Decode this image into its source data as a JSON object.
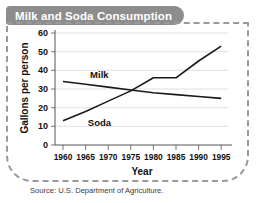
{
  "chart_data": {
    "type": "line",
    "title": "Milk and Soda Consumption",
    "xlabel": "Year",
    "ylabel": "Gallons per person",
    "x": [
      1960,
      1965,
      1970,
      1975,
      1980,
      1985,
      1990,
      1995
    ],
    "xlim": [
      1957,
      1997
    ],
    "ylim": [
      0,
      60
    ],
    "yticks": [
      0,
      10,
      20,
      30,
      40,
      50,
      60
    ],
    "xticks": [
      "1960",
      "1965",
      "1970",
      "1975",
      "1980",
      "1985",
      "1990",
      "1995"
    ],
    "grid": true,
    "legend": "inline-labels",
    "series": [
      {
        "name": "Milk",
        "values": [
          34,
          32.5,
          31,
          29.5,
          28,
          27,
          26,
          25
        ],
        "color": "#1a1a1a",
        "label_x": 1966,
        "label_y": 36
      },
      {
        "name": "Soda",
        "values": [
          13,
          18,
          23.5,
          29,
          36,
          36,
          45,
          53
        ],
        "color": "#1a1a1a",
        "label_x": 1965.5,
        "label_y": 10
      }
    ],
    "source": "Source: U.S. Department of Agriculture.",
    "colors": {
      "banner": "#8d8d8d",
      "banner_text": "#ffffff",
      "line": "#1a1a1a",
      "grid": "#d2d2d2",
      "axis": "#555555",
      "dashed_border": "#9a9a9a",
      "background": "#ffffff"
    }
  }
}
